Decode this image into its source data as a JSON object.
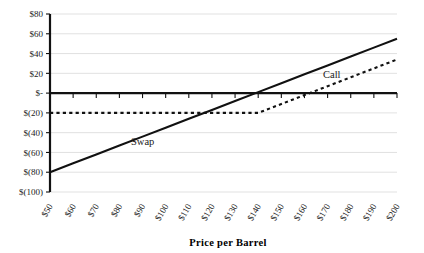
{
  "chart_data": {
    "type": "line",
    "title": "",
    "subtitle": "",
    "xlabel": "Price per Barrel",
    "ylabel": "",
    "grid": true,
    "legend_position": "inline-labels",
    "categories": [
      "$50",
      "$60",
      "$70",
      "$80",
      "$90",
      "$100",
      "$110",
      "$120",
      "$130",
      "$140",
      "$150",
      "$160",
      "$170",
      "$180",
      "$190",
      "$200"
    ],
    "x": [
      50,
      60,
      70,
      80,
      90,
      100,
      110,
      120,
      130,
      140,
      150,
      160,
      170,
      180,
      190,
      200
    ],
    "xlim": [
      50,
      200
    ],
    "ylim": [
      -100,
      80
    ],
    "ytick_values": [
      80,
      60,
      40,
      20,
      0,
      -20,
      -40,
      -60,
      -80,
      -100
    ],
    "ytick_labels": [
      "$80",
      "$60",
      "$40",
      "$20",
      "$-",
      "$(20)",
      "$(40)",
      "$(60)",
      "$(80)",
      "$(100)"
    ],
    "series": [
      {
        "name": "Swap",
        "style": "solid",
        "color": "#111111",
        "label": "Swap",
        "values": [
          -80,
          -71,
          -62,
          -53,
          -44,
          -35,
          -26,
          -17,
          -8,
          1,
          10,
          19,
          28,
          37,
          46,
          55
        ]
      },
      {
        "name": "Call",
        "style": "dashed",
        "color": "#111111",
        "label": "Call",
        "values": [
          -20,
          -20,
          -20,
          -20,
          -20,
          -20,
          -20,
          -20,
          -20,
          -20,
          -11,
          -2,
          7,
          16,
          25,
          34
        ]
      }
    ],
    "annotations": [
      {
        "text": "Swap",
        "x": 85,
        "y": -52
      },
      {
        "text": "Call",
        "x": 168,
        "y": 15
      }
    ]
  }
}
